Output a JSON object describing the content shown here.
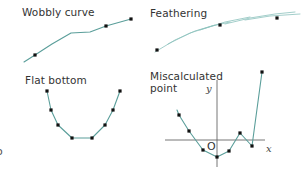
{
  "colors": {
    "curve": "#5a9e9a",
    "feather": "#8cc2bd",
    "axis": "#666666",
    "point": "#111111",
    "text": "#333333"
  },
  "panels": [
    {
      "id": "wobbly-curve",
      "title": "Wobbly curve",
      "curve": [
        [
          24,
          62
        ],
        [
          35,
          55
        ],
        [
          52,
          44
        ],
        [
          71,
          33
        ],
        [
          90,
          32
        ],
        [
          106,
          26
        ],
        [
          131,
          19
        ]
      ],
      "points": [
        [
          35,
          55
        ],
        [
          106,
          26
        ],
        [
          131,
          19
        ]
      ]
    },
    {
      "id": "feathering",
      "title": "Feathering",
      "strokes": [
        [
          [
            155,
            52
          ],
          [
            175,
            40
          ],
          [
            195,
            31
          ],
          [
            215,
            25
          ]
        ],
        [
          [
            168,
            44
          ],
          [
            190,
            33
          ],
          [
            212,
            26
          ],
          [
            230,
            22
          ]
        ],
        [
          [
            200,
            30
          ],
          [
            225,
            22
          ],
          [
            250,
            17
          ]
        ],
        [
          [
            225,
            24
          ],
          [
            250,
            18
          ],
          [
            275,
            14
          ],
          [
            295,
            12
          ]
        ],
        [
          [
            245,
            20
          ],
          [
            270,
            16
          ],
          [
            300,
            14
          ]
        ]
      ],
      "points": [
        [
          157,
          50
        ],
        [
          220,
          25
        ],
        [
          277,
          18
        ]
      ]
    },
    {
      "id": "flat-bottom",
      "title": "Flat bottom",
      "curve": [
        [
          47,
          91
        ],
        [
          51,
          110
        ],
        [
          58,
          125
        ],
        [
          72,
          138
        ],
        [
          92,
          138
        ],
        [
          105,
          125
        ],
        [
          113,
          110
        ],
        [
          120,
          91
        ]
      ],
      "points": [
        [
          47,
          91
        ],
        [
          51,
          110
        ],
        [
          58,
          125
        ],
        [
          72,
          138
        ],
        [
          92,
          138
        ],
        [
          105,
          125
        ],
        [
          113,
          110
        ],
        [
          120,
          91
        ]
      ]
    },
    {
      "id": "miscalculated-point",
      "title": "Miscalculated point",
      "axes": {
        "x_label": "x",
        "y_label": "y",
        "origin_label": "O"
      },
      "curve": [
        [
          177,
          110
        ],
        [
          179,
          115
        ],
        [
          189,
          131
        ],
        [
          203,
          150
        ],
        [
          217,
          157
        ],
        [
          229,
          151
        ],
        [
          240,
          133
        ],
        [
          252,
          146
        ],
        [
          262,
          72
        ]
      ],
      "points": [
        [
          179,
          115
        ],
        [
          189,
          131
        ],
        [
          203,
          150
        ],
        [
          217,
          157
        ],
        [
          229,
          151
        ],
        [
          240,
          133
        ],
        [
          252,
          146
        ],
        [
          262,
          72
        ]
      ]
    }
  ],
  "margin_fragment": "o"
}
